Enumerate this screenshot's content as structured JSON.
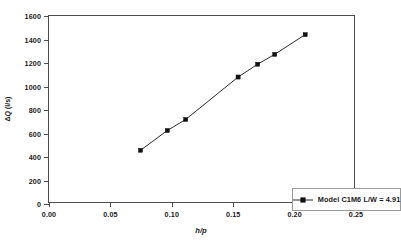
{
  "chart_data": {
    "type": "line",
    "title": "",
    "xlabel": "h/p",
    "ylabel": "ΔQ (l/s)",
    "xlim": [
      0.0,
      0.25
    ],
    "ylim": [
      0,
      1600
    ],
    "grid": false,
    "legend_position": "lower-right",
    "xticks": [
      "0.00",
      "0.05",
      "0.10",
      "0.15",
      "0.20",
      "0.25"
    ],
    "xtick_values": [
      0.0,
      0.05,
      0.1,
      0.15,
      0.2,
      0.25
    ],
    "yticks": [
      "0",
      "200",
      "400",
      "600",
      "800",
      "1000",
      "1200",
      "1400",
      "1600"
    ],
    "ytick_values": [
      0,
      200,
      400,
      600,
      800,
      1000,
      1200,
      1400,
      1600
    ],
    "series": [
      {
        "name": "Model C1M6 L/W = 4.91",
        "marker": "square",
        "color": "#111111",
        "x": [
          0.075,
          0.097,
          0.112,
          0.155,
          0.171,
          0.185,
          0.21
        ],
        "values": [
          445,
          615,
          710,
          1075,
          1185,
          1270,
          1440
        ]
      }
    ]
  },
  "axes": {
    "y_title_delta": "Δ",
    "y_title_q": "Q",
    "y_title_units": " (l/s)",
    "x_title": "h/p"
  },
  "legend": {
    "entry_label": "Model C1M6 L/W = 4.91"
  }
}
